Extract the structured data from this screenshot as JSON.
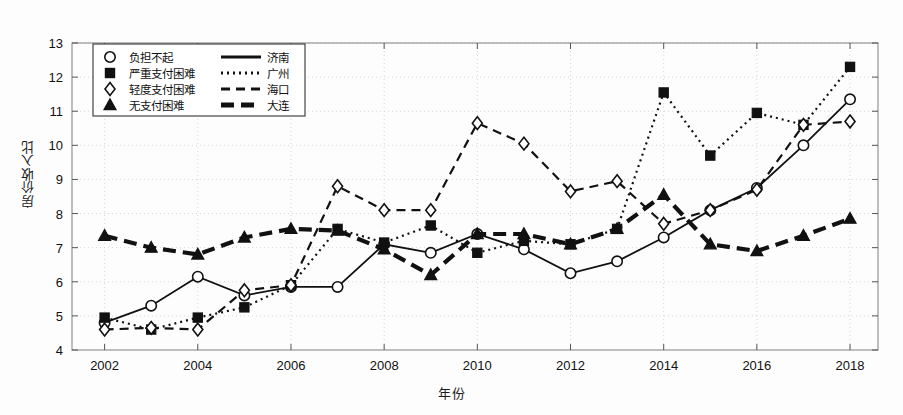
{
  "chart_data": {
    "type": "line",
    "title": "",
    "xlabel": "年份",
    "ylabel": "房价收入比",
    "xlim": [
      2001.3,
      2018.6
    ],
    "ylim": [
      4,
      13
    ],
    "yticks": [
      4,
      5,
      6,
      7,
      8,
      9,
      10,
      11,
      12,
      13
    ],
    "xticks": [
      2002,
      2004,
      2006,
      2008,
      2010,
      2012,
      2014,
      2016,
      2018
    ],
    "x": [
      2002,
      2003,
      2004,
      2005,
      2006,
      2007,
      2008,
      2009,
      2010,
      2011,
      2012,
      2013,
      2014,
      2015,
      2016,
      2017,
      2018
    ],
    "grid": true,
    "legend_position": "upper-left",
    "series": [
      {
        "name": "济南",
        "marker": "circle",
        "linestyle": "solid",
        "color": "#111111",
        "values": [
          4.8,
          5.3,
          6.15,
          5.6,
          5.85,
          5.85,
          7.1,
          6.85,
          7.4,
          6.95,
          6.25,
          6.6,
          7.3,
          8.1,
          8.75,
          10.0,
          11.35
        ]
      },
      {
        "name": "广州",
        "marker": "square",
        "linestyle": "dotted",
        "color": "#111111",
        "values": [
          4.95,
          4.6,
          4.95,
          5.25,
          5.9,
          7.55,
          7.15,
          7.65,
          6.85,
          7.2,
          7.1,
          7.55,
          11.55,
          9.7,
          10.95,
          10.6,
          12.3
        ]
      },
      {
        "name": "海口",
        "marker": "diamond",
        "linestyle": "dashed",
        "color": "#111111",
        "values": [
          4.6,
          4.65,
          4.6,
          5.75,
          5.9,
          8.8,
          8.1,
          8.1,
          10.65,
          10.05,
          8.65,
          8.95,
          7.7,
          8.1,
          8.7,
          10.6,
          10.7
        ]
      },
      {
        "name": "大连",
        "marker": "triangle",
        "linestyle": "thick-dash",
        "color": "#111111",
        "values": [
          7.35,
          7.0,
          6.8,
          7.3,
          7.55,
          7.5,
          6.95,
          6.2,
          7.4,
          7.4,
          7.1,
          7.55,
          8.55,
          7.1,
          6.9,
          7.35,
          7.85
        ]
      }
    ],
    "legend_entries": [
      {
        "marker": "circle",
        "category": "负担不起",
        "line": "solid",
        "city": "济南"
      },
      {
        "marker": "square",
        "category": "严重支付困难",
        "line": "dotted",
        "city": "广州"
      },
      {
        "marker": "diamond",
        "category": "轻度支付困难",
        "line": "dashed",
        "city": "海口"
      },
      {
        "marker": "triangle",
        "category": "无支付困难",
        "line": "thick-dash",
        "city": "大连"
      }
    ]
  }
}
